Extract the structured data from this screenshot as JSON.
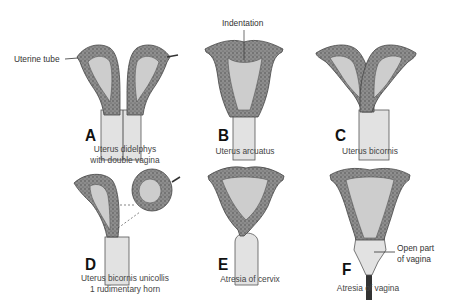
{
  "figure": {
    "panels": [
      {
        "letter": "A",
        "caption_line1": "Uterus didelphys",
        "caption_line2": "with double vagina"
      },
      {
        "letter": "B",
        "caption_line1": "Uterus arcuatus",
        "caption_line2": ""
      },
      {
        "letter": "C",
        "caption_line1": "Uterus bicornis",
        "caption_line2": ""
      },
      {
        "letter": "D",
        "caption_line1": "Uterus bicornis unicollis",
        "caption_line2": "1 rudimentary horn"
      },
      {
        "letter": "E",
        "caption_line1": "Atresia of cervix",
        "caption_line2": ""
      },
      {
        "letter": "F",
        "caption_line1": "Atresia of vagina",
        "caption_line2": ""
      }
    ],
    "annotations": {
      "uterine_tube": "Uterine tube",
      "indentation": "Indentation",
      "open_part_line1": "Open part",
      "open_part_line2": "of vagina"
    },
    "colors": {
      "wall": "#8a8a8a",
      "wall_dark": "#5a5a5a",
      "cavity": "#cfcfcf",
      "vagina": "#e4e4e4",
      "outline": "#444444"
    }
  }
}
